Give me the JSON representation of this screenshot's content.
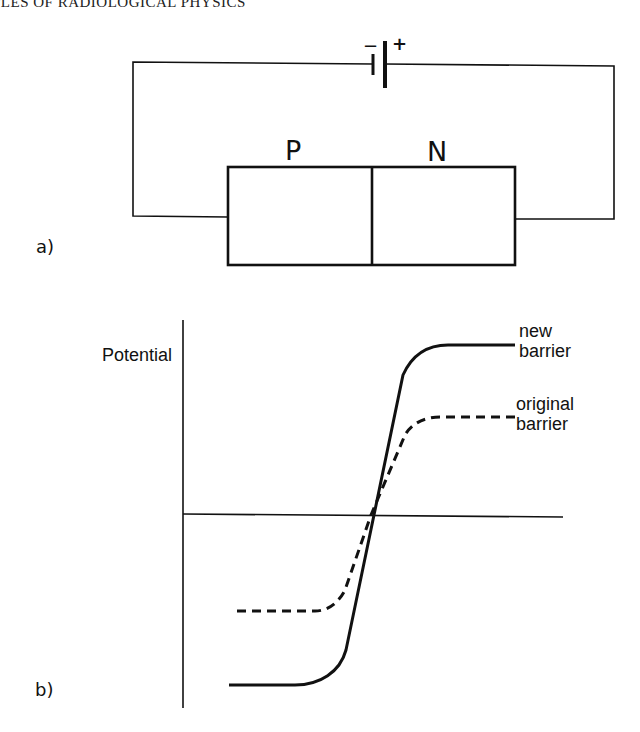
{
  "header": {
    "running_title": "PLES OF RADIOLOGICAL PHYSICS"
  },
  "panel_a": {
    "label": "a)",
    "battery": {
      "minus": "−",
      "plus": "+"
    },
    "junction": {
      "p_label": "P",
      "n_label": "N"
    }
  },
  "panel_b": {
    "label": "b)",
    "y_axis_label": "Potential",
    "curves": [
      {
        "name": "new barrier",
        "label_line1": "new",
        "label_line2": "barrier",
        "style": "solid"
      },
      {
        "name": "original barrier",
        "label_line1": "original",
        "label_line2": "barrier",
        "style": "dashed"
      }
    ]
  },
  "colors": {
    "ink": "#111111",
    "background": "#ffffff"
  }
}
